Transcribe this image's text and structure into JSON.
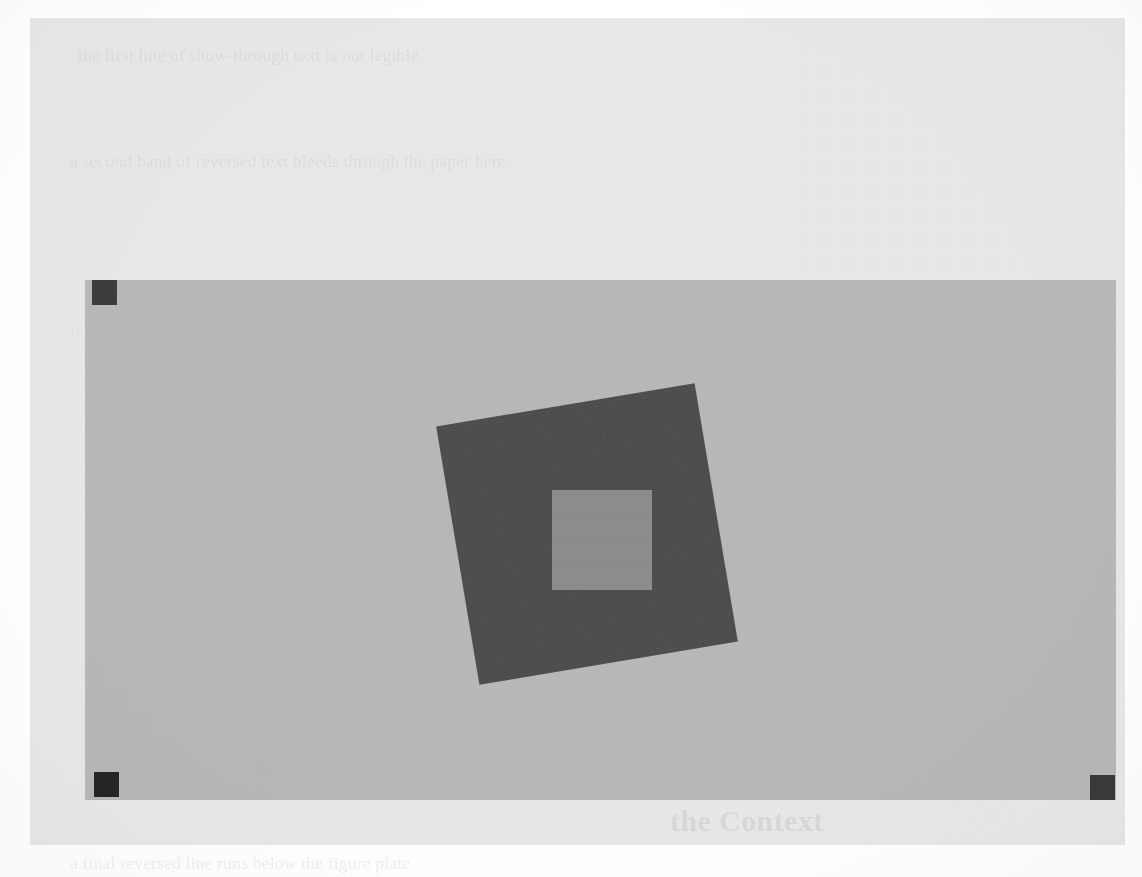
{
  "page": {
    "media": "scanned-document-page",
    "background_color": "#ffffff",
    "sheet_color": "#e8e8e8"
  },
  "ghost_text": {
    "note": "faint bleed-through text from the reverse side of the scanned sheet; largely illegible",
    "top_line": "the first line of show-through text is not legible",
    "mid_line": "a second band of reversed text bleeds through the paper here",
    "right_column": "further reversed body text occupies the right half of the page",
    "left_column": "reversed body text continues down the left margin of the sheet",
    "heading": "the Context",
    "bottom_line": "a final reversed line runs below the figure plate"
  },
  "figure": {
    "caption": "",
    "plate": {
      "label": "light gray calibration plate",
      "color": "#b8b8b8",
      "x": 55,
      "y": 262,
      "width": 1031,
      "height": 520
    },
    "fiducial_markers": [
      {
        "label": "top-left fiducial",
        "color": "#3c3c3c",
        "x": 62,
        "y": 262,
        "size": 25
      },
      {
        "label": "bottom-left fiducial",
        "color": "#252525",
        "x": 64,
        "y": 754,
        "size": 25
      },
      {
        "label": "bottom-right fiducial",
        "color": "#3a3a3a",
        "x": 1060,
        "y": 757,
        "size": 25
      }
    ],
    "rotated_square": {
      "label": "dark rotated square",
      "color": "#4e4e4e",
      "x": 426,
      "y": 385,
      "width": 262,
      "height": 262,
      "rotation_degrees": -9.5
    },
    "inner_square": {
      "label": "light inner square",
      "color": "#8d8d8d",
      "x": 522,
      "y": 472,
      "width": 100,
      "height": 100,
      "rotation_degrees": 0
    }
  }
}
